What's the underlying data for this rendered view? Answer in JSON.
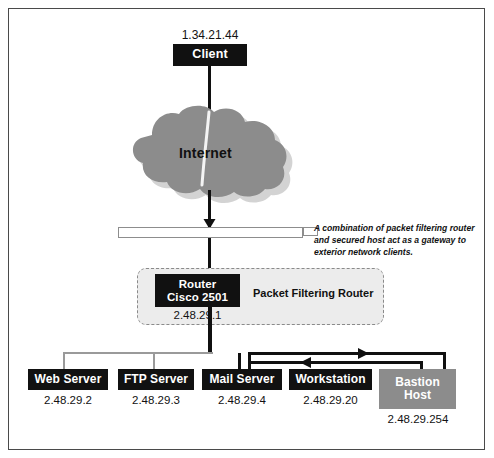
{
  "diagram": {
    "colors": {
      "node_black": "#111111",
      "node_gray": "#8c8c8c",
      "cloud_gray": "#8c8c8c",
      "zone_fill": "#ececec",
      "zone_border": "#8a8a8a",
      "line_black": "#101010",
      "line_thin": "#9a9a9a",
      "frame": "#4a4a4a",
      "background": "#ffffff"
    }
  },
  "client": {
    "ip": "1.34.21.44",
    "label": "Client"
  },
  "cloud": {
    "label": "Internet"
  },
  "annotation": {
    "text": "A combination of packet filtering router and secured host act as a gateway to exterior network clients."
  },
  "router_zone": {
    "zone_label": "Packet Filtering Router",
    "device": {
      "line1": "Router",
      "line2": "Cisco 2501",
      "ip": "2.48.29.1"
    }
  },
  "hosts": [
    {
      "label": "Web Server",
      "ip": "2.48.29.2",
      "style": "black"
    },
    {
      "label": "FTP Server",
      "ip": "2.48.29.3",
      "style": "black"
    },
    {
      "label": "Mail Server",
      "ip": "2.48.29.4",
      "style": "black"
    },
    {
      "label": "Workstation",
      "ip": "2.48.29.20",
      "style": "black"
    },
    {
      "label": "Bastion Host",
      "ip": "2.48.29.254",
      "style": "gray",
      "line1": "Bastion",
      "line2": "Host"
    }
  ]
}
